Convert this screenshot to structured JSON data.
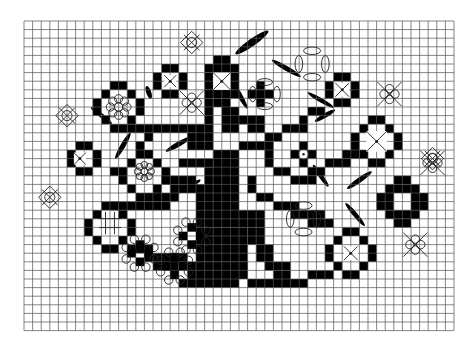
{
  "pattern": {
    "title": "Tree of life cross-stitch chart",
    "grid": {
      "left": 24,
      "top": 21,
      "cell": 8.6,
      "cols": 50,
      "rows": 36,
      "line_color": "#555555",
      "bg": "#ffffff",
      "fill": "#000000"
    },
    "filled_rects": [
      [
        22,
        4,
        2,
        1
      ],
      [
        21,
        5,
        4,
        1
      ],
      [
        21,
        6,
        1,
        2
      ],
      [
        24,
        6,
        1,
        2
      ],
      [
        21,
        8,
        4,
        1
      ],
      [
        22,
        9,
        2,
        1
      ],
      [
        16,
        5,
        2,
        1
      ],
      [
        15,
        6,
        1,
        2
      ],
      [
        18,
        6,
        1,
        2
      ],
      [
        16,
        8,
        2,
        1
      ],
      [
        10,
        7,
        2,
        1
      ],
      [
        9,
        8,
        1,
        1
      ],
      [
        12,
        8,
        1,
        1
      ],
      [
        8,
        9,
        1,
        2
      ],
      [
        13,
        9,
        1,
        2
      ],
      [
        9,
        11,
        1,
        1
      ],
      [
        12,
        11,
        1,
        1
      ],
      [
        10,
        12,
        2,
        1
      ],
      [
        36,
        6,
        2,
        1
      ],
      [
        35,
        7,
        1,
        2
      ],
      [
        38,
        7,
        1,
        2
      ],
      [
        36,
        9,
        2,
        1
      ],
      [
        27,
        7,
        1,
        1
      ],
      [
        26,
        8,
        3,
        1
      ],
      [
        27,
        9,
        1,
        1
      ],
      [
        6,
        14,
        2,
        1
      ],
      [
        5,
        15,
        1,
        2
      ],
      [
        8,
        15,
        1,
        2
      ],
      [
        6,
        17,
        2,
        1
      ],
      [
        13,
        15,
        2,
        1
      ],
      [
        12,
        16,
        1,
        1
      ],
      [
        15,
        16,
        1,
        1
      ],
      [
        11,
        17,
        1,
        2
      ],
      [
        16,
        17,
        1,
        2
      ],
      [
        12,
        19,
        1,
        1
      ],
      [
        15,
        19,
        1,
        1
      ],
      [
        13,
        20,
        2,
        1
      ],
      [
        9,
        21,
        2,
        1
      ],
      [
        8,
        22,
        1,
        1
      ],
      [
        11,
        22,
        1,
        1
      ],
      [
        7,
        23,
        1,
        2
      ],
      [
        12,
        23,
        1,
        2
      ],
      [
        8,
        25,
        1,
        1
      ],
      [
        11,
        25,
        1,
        1
      ],
      [
        9,
        26,
        2,
        1
      ],
      [
        40,
        11,
        2,
        1
      ],
      [
        39,
        12,
        1,
        1
      ],
      [
        42,
        12,
        1,
        1
      ],
      [
        38,
        13,
        1,
        2
      ],
      [
        43,
        13,
        1,
        2
      ],
      [
        39,
        15,
        1,
        1
      ],
      [
        42,
        15,
        1,
        1
      ],
      [
        40,
        16,
        2,
        1
      ],
      [
        43,
        18,
        2,
        1
      ],
      [
        42,
        19,
        4,
        1
      ],
      [
        41,
        20,
        2,
        2
      ],
      [
        45,
        20,
        2,
        2
      ],
      [
        42,
        22,
        4,
        1
      ],
      [
        43,
        23,
        2,
        1
      ],
      [
        37,
        24,
        2,
        1
      ],
      [
        36,
        25,
        1,
        1
      ],
      [
        39,
        25,
        1,
        1
      ],
      [
        35,
        26,
        1,
        2
      ],
      [
        40,
        26,
        1,
        2
      ],
      [
        36,
        28,
        1,
        1
      ],
      [
        39,
        28,
        1,
        1
      ],
      [
        37,
        29,
        2,
        1
      ],
      [
        31,
        15,
        1,
        1
      ],
      [
        32,
        14,
        1,
        1
      ],
      [
        33,
        15,
        1,
        1
      ],
      [
        32,
        16,
        1,
        1
      ],
      [
        12,
        12,
        8,
        1
      ],
      [
        14,
        13,
        1,
        1
      ],
      [
        19,
        13,
        1,
        2
      ],
      [
        13,
        14,
        1,
        1
      ],
      [
        20,
        12,
        2,
        3
      ],
      [
        21,
        9,
        1,
        3
      ],
      [
        23,
        10,
        2,
        3
      ],
      [
        25,
        11,
        3,
        1
      ],
      [
        26,
        12,
        2,
        1
      ],
      [
        28,
        13,
        2,
        1
      ],
      [
        18,
        16,
        4,
        1
      ],
      [
        16,
        18,
        4,
        1
      ],
      [
        10,
        17,
        1,
        1
      ],
      [
        22,
        15,
        3,
        3
      ],
      [
        25,
        14,
        4,
        1
      ],
      [
        28,
        15,
        1,
        2
      ],
      [
        29,
        17,
        2,
        1
      ],
      [
        31,
        18,
        3,
        1
      ],
      [
        33,
        17,
        2,
        1
      ],
      [
        35,
        16,
        3,
        1
      ],
      [
        37,
        15,
        2,
        1
      ],
      [
        17,
        19,
        7,
        1
      ],
      [
        15,
        20,
        3,
        1
      ],
      [
        10,
        21,
        7,
        1
      ],
      [
        21,
        17,
        4,
        3
      ],
      [
        20,
        20,
        5,
        4
      ],
      [
        20,
        24,
        6,
        4
      ],
      [
        19,
        28,
        7,
        2
      ],
      [
        18,
        30,
        7,
        1
      ],
      [
        26,
        18,
        1,
        2
      ],
      [
        27,
        20,
        2,
        1
      ],
      [
        29,
        21,
        3,
        1
      ],
      [
        31,
        22,
        4,
        1
      ],
      [
        33,
        23,
        3,
        1
      ],
      [
        25,
        22,
        3,
        2
      ],
      [
        26,
        24,
        2,
        2
      ],
      [
        27,
        26,
        2,
        2
      ],
      [
        28,
        28,
        3,
        1
      ],
      [
        29,
        29,
        2,
        1
      ],
      [
        14,
        27,
        5,
        1
      ],
      [
        12,
        26,
        3,
        1
      ],
      [
        15,
        28,
        3,
        1
      ],
      [
        25,
        28,
        1,
        2
      ],
      [
        26,
        30,
        7,
        1
      ],
      [
        33,
        29,
        3,
        1
      ],
      [
        30,
        12,
        2,
        1
      ],
      [
        32,
        11,
        1,
        2
      ],
      [
        33,
        10,
        2,
        1
      ]
    ],
    "leaves": [
      [
        26.5,
        2.5,
        24,
        3.8,
        -35
      ],
      [
        14.5,
        8.3,
        8,
        2.5,
        70
      ],
      [
        9,
        11,
        16,
        2.2,
        38
      ],
      [
        11.5,
        14.5,
        18,
        2.5,
        -60
      ],
      [
        18,
        14.3,
        18,
        2.5,
        -30
      ],
      [
        25,
        8.5,
        20,
        2.5,
        60
      ],
      [
        19,
        19.3,
        18,
        2.5,
        -28
      ],
      [
        34.5,
        18,
        16,
        2.3,
        55
      ],
      [
        39,
        18.5,
        18,
        2.5,
        -35
      ],
      [
        38.5,
        22.5,
        18,
        2.3,
        50
      ],
      [
        30.5,
        5.5,
        20,
        2.5,
        30
      ],
      [
        35,
        11,
        14,
        2.3,
        -30
      ],
      [
        34.5,
        9.2,
        18,
        2.3,
        30
      ]
    ],
    "motifs": [
      {
        "kind": "diamond-x",
        "x": 19.5,
        "y": 2.5,
        "r": 1.3
      },
      {
        "kind": "diamond-x",
        "x": 5,
        "y": 11,
        "r": 1.3
      },
      {
        "kind": "diamond-x",
        "x": 3,
        "y": 20.5,
        "r": 1.3
      },
      {
        "kind": "diamond-x",
        "x": 47.5,
        "y": 16,
        "r": 1.3
      },
      {
        "kind": "cross-x",
        "x": 23,
        "y": 7,
        "r": 1
      },
      {
        "kind": "cross-x",
        "x": 37,
        "y": 8,
        "r": 0.8
      },
      {
        "kind": "cross-x",
        "x": 17,
        "y": 7,
        "r": 0.7
      },
      {
        "kind": "cross-x",
        "x": 6.5,
        "y": 16,
        "r": 0.7
      },
      {
        "kind": "cross-x",
        "x": 38,
        "y": 27,
        "r": 0.8
      },
      {
        "kind": "cross-x",
        "x": 41,
        "y": 14,
        "r": 1.2
      },
      {
        "kind": "quatrefoil-x",
        "x": 42.5,
        "y": 8.5,
        "r": 1.4
      },
      {
        "kind": "quatrefoil-x",
        "x": 47.5,
        "y": 16.5,
        "r": 1.4
      },
      {
        "kind": "quatrefoil-x",
        "x": 45.5,
        "y": 26,
        "r": 1.4
      },
      {
        "kind": "quatrefoil-x",
        "x": 19.5,
        "y": 9.5,
        "r": 1.4
      },
      {
        "kind": "rosette",
        "x": 11,
        "y": 10,
        "r": 1.6
      },
      {
        "kind": "rosette",
        "x": 14,
        "y": 17.5,
        "r": 1.3
      },
      {
        "kind": "hash",
        "x": 10,
        "y": 23.5,
        "r": 1.3
      },
      {
        "kind": "ring-quatrefoil",
        "x": 33.5,
        "y": 5,
        "r": 2.2
      },
      {
        "kind": "ring-quatrefoil",
        "x": 28,
        "y": 8.5,
        "r": 2
      },
      {
        "kind": "ring-quatrefoil",
        "x": 32.5,
        "y": 23,
        "r": 2.2
      },
      {
        "kind": "dot-ring",
        "x": 32.5,
        "y": 15.5,
        "r": 0.5
      },
      {
        "kind": "flower",
        "x": 13.5,
        "y": 27,
        "r": 1.4
      },
      {
        "kind": "flower",
        "x": 17.5,
        "y": 28.5,
        "r": 1.4
      },
      {
        "kind": "flower",
        "x": 19.5,
        "y": 25,
        "r": 1.4
      }
    ]
  }
}
